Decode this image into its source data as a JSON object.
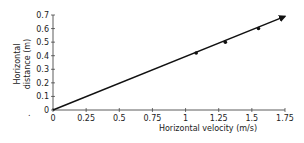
{
  "chart_data": {
    "type": "line",
    "title": "",
    "xlabel": "Horizontal velocity (m/s)",
    "ylabel": "Horizontal distance (m)",
    "ylabel_lines": [
      "Horizontal",
      "distance (m)"
    ],
    "xlim": [
      0,
      1.75
    ],
    "ylim": [
      0,
      0.7
    ],
    "x_ticks": [
      "0",
      "0.25",
      "0.5",
      "0.75",
      "1",
      "1.25",
      "1.5",
      "1.75"
    ],
    "y_ticks": [
      "0",
      "0.1",
      "0.2",
      "0.3",
      "0.4",
      "0.5",
      "0.6",
      "0.7"
    ],
    "grid": false,
    "legend": null,
    "series": [
      {
        "name": "Horizontal distance vs velocity",
        "line": {
          "x": [
            0,
            1.75
          ],
          "y": [
            0,
            0.69
          ],
          "arrow_end": true
        },
        "points": {
          "x": [
            1.08,
            1.3,
            1.55
          ],
          "y": [
            0.42,
            0.5,
            0.6
          ]
        }
      }
    ],
    "line_color": "#111111"
  },
  "stray_mark": "."
}
